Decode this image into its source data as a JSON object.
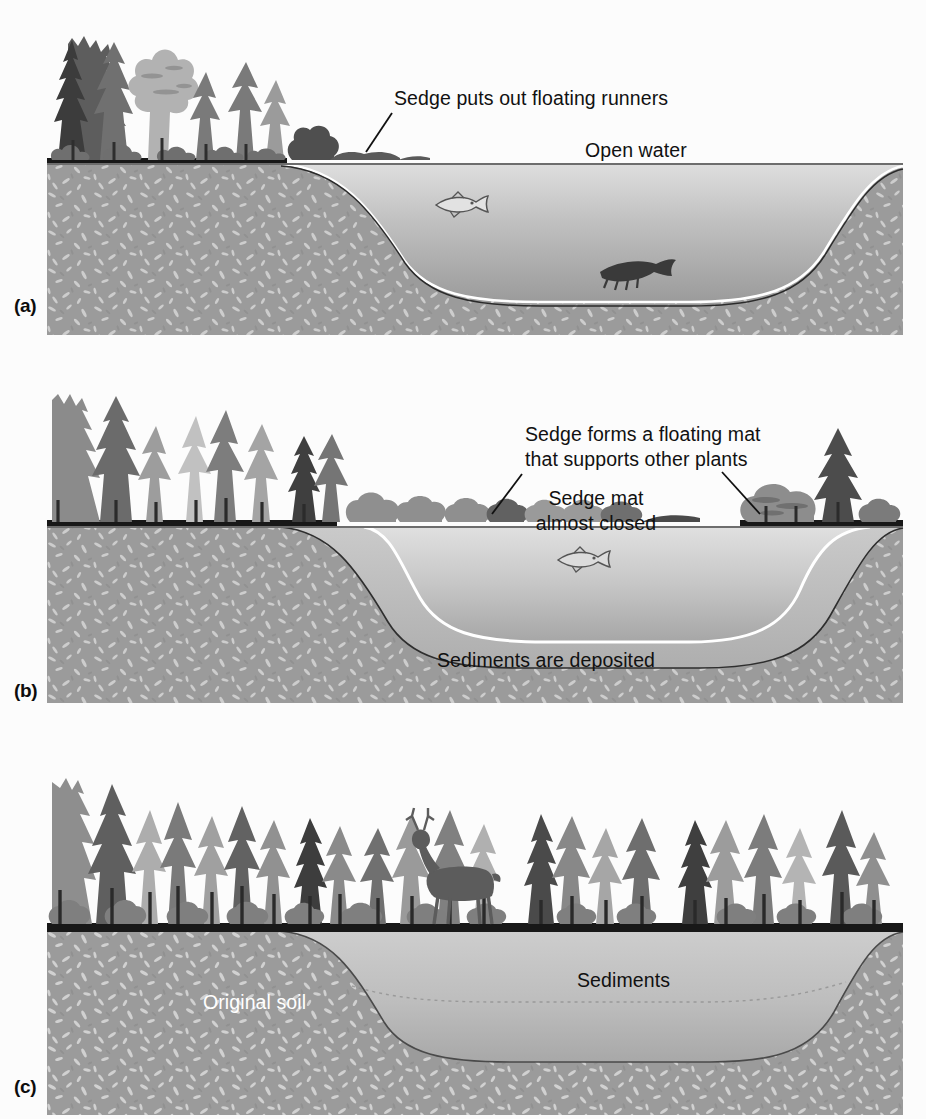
{
  "figure": {
    "panels": [
      {
        "id": "a",
        "label": "(a)",
        "stage_name": "open-water-stage",
        "annotations": [
          {
            "name": "sedge-runners-label",
            "text": "Sedge puts out floating runners",
            "color": "#111111"
          },
          {
            "name": "open-water-label",
            "text": "Open water",
            "color": "#111111"
          }
        ],
        "organisms": [
          "fish",
          "bottom-fish"
        ],
        "features": [
          "open water",
          "original soil",
          "shoreline forest",
          "sedge runners"
        ]
      },
      {
        "id": "b",
        "label": "(b)",
        "stage_name": "floating-mat-stage",
        "annotations": [
          {
            "name": "sedge-mat-plants-label",
            "text": "Sedge forms a floating mat\nthat supports other plants",
            "color": "#111111"
          },
          {
            "name": "sedge-mat-closed-label",
            "text": "Sedge mat\nalmost closed",
            "color": "#111111"
          },
          {
            "name": "sediments-deposited-label",
            "text": "Sediments are deposited",
            "color": "#111111"
          }
        ],
        "organisms": [
          "fish"
        ],
        "features": [
          "shrinking open water",
          "floating sedge mat",
          "sediment layer",
          "original soil",
          "forest"
        ]
      },
      {
        "id": "c",
        "label": "(c)",
        "stage_name": "filled-forest-stage",
        "annotations": [
          {
            "name": "original-soil-label",
            "text": "Original soil",
            "color": "#ffffff"
          },
          {
            "name": "sediments-label",
            "text": "Sediments",
            "color": "#111111"
          }
        ],
        "organisms": [
          "deer"
        ],
        "features": [
          "basin completely filled with sediments",
          "continuous forest",
          "original soil"
        ]
      }
    ]
  },
  "colors": {
    "page_background": "#fcfcfc",
    "soil_base": "#9a9a9a",
    "soil_speckle_light": "#cfcfcf",
    "water_light": "#d9d9d9",
    "water_dark": "#9d9d9d",
    "sediment_light": "#c8c8c8",
    "sediment_dark": "#b0b0b0",
    "ground_line": "#1a1a1a",
    "tree_dark": "#4a4a4a",
    "tree_mid": "#7d7d7d",
    "tree_light": "#a9a9a9",
    "tree_pale": "#c4c4c4",
    "highlight_line": "#ffffff",
    "text_dark": "#111111",
    "text_light": "#ffffff"
  }
}
